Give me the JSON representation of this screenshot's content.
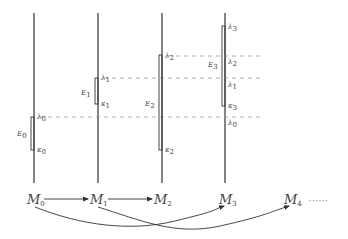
{
  "diagram": {
    "columns": [
      {
        "id": "col0",
        "x": 34
      },
      {
        "id": "col1",
        "x": 98
      },
      {
        "id": "col2",
        "x": 162
      },
      {
        "id": "col3",
        "x": 225
      }
    ],
    "intervals": [
      {
        "name": "E",
        "sub": "0",
        "top_label": "λ",
        "top_sub": "0",
        "bottom_label": "κ",
        "bottom_sub": "0"
      },
      {
        "name": "E",
        "sub": "1",
        "top_label": "λ",
        "top_sub": "1",
        "bottom_label": "κ",
        "bottom_sub": "1"
      },
      {
        "name": "E",
        "sub": "2",
        "top_label": "λ",
        "top_sub": "2",
        "bottom_label": "κ",
        "bottom_sub": "2"
      },
      {
        "name": "E",
        "sub": "3",
        "top_label": "λ",
        "top_sub": "3",
        "bottom_label": "κ",
        "bottom_sub": "3"
      }
    ],
    "col3_marks": [
      {
        "label": "λ",
        "sub": "2"
      },
      {
        "label": "λ",
        "sub": "1"
      },
      {
        "label": "λ",
        "sub": "0"
      }
    ],
    "models": [
      {
        "label": "M",
        "sub": "0"
      },
      {
        "label": "M",
        "sub": "1"
      },
      {
        "label": "M",
        "sub": "2"
      },
      {
        "label": "M",
        "sub": "3"
      },
      {
        "label": "M",
        "sub": "4"
      }
    ],
    "ellipsis": "······",
    "colors": {
      "line": "#333333",
      "dash": "#9a9a9a",
      "text": "#444444"
    }
  }
}
